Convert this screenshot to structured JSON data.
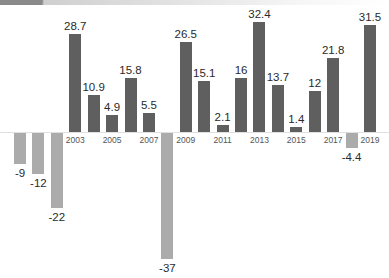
{
  "chart_data": {
    "type": "bar",
    "title": "",
    "xlabel": "",
    "ylabel": "",
    "categories": [
      "2000",
      "2001",
      "2002",
      "2003",
      "2004",
      "2005",
      "2006",
      "2007",
      "2008",
      "2009",
      "2010",
      "2011",
      "2012",
      "2013",
      "2014",
      "2015",
      "2016",
      "2017",
      "2018",
      "2019"
    ],
    "values": [
      -9,
      -12,
      -22,
      28.7,
      10.9,
      4.9,
      15.8,
      5.5,
      -37,
      26.5,
      15.1,
      2.1,
      16,
      32.4,
      13.7,
      1.4,
      12,
      21.8,
      -4.4,
      31.5
    ],
    "value_labels": [
      "-9",
      "-12",
      "-22",
      "28.7",
      "10.9",
      "4.9",
      "15.8",
      "5.5",
      "-37",
      "26.5",
      "15.1",
      "2.1",
      "16",
      "32.4",
      "13.7",
      "1.4",
      "12",
      "21.8",
      "-4.4",
      "31.5"
    ],
    "visible_tick_labels": [
      "2003",
      "2005",
      "2007",
      "2009",
      "2011",
      "2013",
      "2015",
      "2017",
      "2019"
    ],
    "ylim": [
      -37,
      32.4
    ],
    "grid": false,
    "legend": null,
    "colors": {
      "positive": "#5f5f5f",
      "negative": "#ababab",
      "header_dark": "#8a8a8a",
      "text": "#2a2a2a",
      "tick_text": "#555555"
    }
  }
}
